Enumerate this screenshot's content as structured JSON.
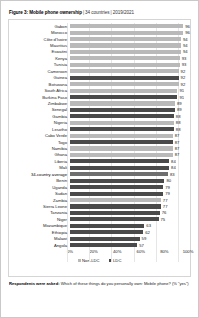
{
  "title": {
    "label": "Figure 3: Mobile phone ownership",
    "separator": "|",
    "countries": "34 countries",
    "period": "2019/2021"
  },
  "footnote": {
    "lead": "Respondents were asked:",
    "text": " Which of these things do you personally own: Mobile phone? (% \"yes\")"
  },
  "legend": {
    "position": "bottom-center",
    "items": [
      {
        "label": "Non-LDC",
        "color": "#b9b9b9",
        "key": "non_ldc"
      },
      {
        "label": "LDC",
        "color": "#4a4a4a",
        "key": "ldc"
      }
    ]
  },
  "axis": {
    "ticks": [
      "0%",
      "20%",
      "40%",
      "60%",
      "80%",
      "100%"
    ],
    "values": [
      0,
      20,
      40,
      60,
      80,
      100
    ]
  },
  "chart_data": {
    "type": "bar",
    "orientation": "horizontal",
    "xlabel": "",
    "ylabel": "",
    "xlim": [
      0,
      100
    ],
    "grid": true,
    "legend_position": "bottom-center",
    "categories": [
      "Gabon",
      "Morocco",
      "Côte d'Ivoire",
      "Mauritius",
      "Eswatini",
      "Kenya",
      "Tunisia",
      "Cameroon",
      "Guinea",
      "Botswana",
      "South Africa",
      "Burkina Faso",
      "Zimbabwe",
      "Senegal",
      "Gambia",
      "Nigeria",
      "Lesotho",
      "Cabo Verde",
      "Togo",
      "Namibia",
      "Ghana",
      "Liberia",
      "Mali",
      "34-country average",
      "Benin",
      "Uganda",
      "Sudan",
      "Zambia",
      "Sierra Leone",
      "Tanzania",
      "Niger",
      "Mozambique",
      "Ethiopia",
      "Malawi",
      "Angola"
    ],
    "values": [
      96,
      96,
      94,
      94,
      94,
      93,
      93,
      92,
      92,
      92,
      91,
      91,
      89,
      89,
      88,
      88,
      88,
      87,
      87,
      87,
      87,
      84,
      84,
      83,
      80,
      79,
      79,
      77,
      77,
      76,
      75,
      63,
      62,
      59,
      57
    ],
    "groups": [
      "non_ldc",
      "non_ldc",
      "non_ldc",
      "non_ldc",
      "non_ldc",
      "non_ldc",
      "non_ldc",
      "non_ldc",
      "ldc",
      "non_ldc",
      "non_ldc",
      "ldc",
      "non_ldc",
      "ldc",
      "ldc",
      "non_ldc",
      "ldc",
      "non_ldc",
      "ldc",
      "non_ldc",
      "non_ldc",
      "ldc",
      "ldc",
      "average",
      "ldc",
      "ldc",
      "ldc",
      "non_ldc",
      "ldc",
      "ldc",
      "ldc",
      "ldc",
      "ldc",
      "ldc",
      "ldc"
    ],
    "series": [
      {
        "name": "Non-LDC",
        "color": "#b9b9b9",
        "points": [
          {
            "category": "Gabon",
            "value": 96
          },
          {
            "category": "Morocco",
            "value": 96
          },
          {
            "category": "Côte d'Ivoire",
            "value": 94
          },
          {
            "category": "Mauritius",
            "value": 94
          },
          {
            "category": "Eswatini",
            "value": 94
          },
          {
            "category": "Kenya",
            "value": 93
          },
          {
            "category": "Tunisia",
            "value": 93
          },
          {
            "category": "Cameroon",
            "value": 92
          },
          {
            "category": "Botswana",
            "value": 92
          },
          {
            "category": "South Africa",
            "value": 91
          },
          {
            "category": "Zimbabwe",
            "value": 89
          },
          {
            "category": "Nigeria",
            "value": 88
          },
          {
            "category": "Cabo Verde",
            "value": 87
          },
          {
            "category": "Namibia",
            "value": 87
          },
          {
            "category": "Ghana",
            "value": 87
          },
          {
            "category": "Zambia",
            "value": 77
          }
        ]
      },
      {
        "name": "LDC",
        "color": "#4a4a4a",
        "points": [
          {
            "category": "Guinea",
            "value": 92
          },
          {
            "category": "Burkina Faso",
            "value": 91
          },
          {
            "category": "Senegal",
            "value": 89
          },
          {
            "category": "Gambia",
            "value": 88
          },
          {
            "category": "Lesotho",
            "value": 88
          },
          {
            "category": "Togo",
            "value": 87
          },
          {
            "category": "Liberia",
            "value": 84
          },
          {
            "category": "Mali",
            "value": 84
          },
          {
            "category": "Benin",
            "value": 80
          },
          {
            "category": "Uganda",
            "value": 79
          },
          {
            "category": "Sudan",
            "value": 79
          },
          {
            "category": "Sierra Leone",
            "value": 77
          },
          {
            "category": "Tanzania",
            "value": 76
          },
          {
            "category": "Niger",
            "value": 75
          },
          {
            "category": "Mozambique",
            "value": 63
          },
          {
            "category": "Ethiopia",
            "value": 62
          },
          {
            "category": "Malawi",
            "value": 59
          },
          {
            "category": "Angola",
            "value": 57
          }
        ]
      },
      {
        "name": "34-country average",
        "color": "#6f6f6f",
        "points": [
          {
            "category": "34-country average",
            "value": 83
          }
        ]
      }
    ],
    "rows": [
      {
        "label": "Gabon",
        "value": 96,
        "group": "non_ldc"
      },
      {
        "label": "Morocco",
        "value": 96,
        "group": "non_ldc"
      },
      {
        "label": "Côte d'Ivoire",
        "value": 94,
        "group": "non_ldc"
      },
      {
        "label": "Mauritius",
        "value": 94,
        "group": "non_ldc"
      },
      {
        "label": "Eswatini",
        "value": 94,
        "group": "non_ldc"
      },
      {
        "label": "Kenya",
        "value": 93,
        "group": "non_ldc"
      },
      {
        "label": "Tunisia",
        "value": 93,
        "group": "non_ldc"
      },
      {
        "label": "Cameroon",
        "value": 92,
        "group": "non_ldc"
      },
      {
        "label": "Guinea",
        "value": 92,
        "group": "ldc"
      },
      {
        "label": "Botswana",
        "value": 92,
        "group": "non_ldc"
      },
      {
        "label": "South Africa",
        "value": 91,
        "group": "non_ldc"
      },
      {
        "label": "Burkina Faso",
        "value": 91,
        "group": "ldc"
      },
      {
        "label": "Zimbabwe",
        "value": 89,
        "group": "non_ldc"
      },
      {
        "label": "Senegal",
        "value": 89,
        "group": "ldc"
      },
      {
        "label": "Gambia",
        "value": 88,
        "group": "ldc"
      },
      {
        "label": "Nigeria",
        "value": 88,
        "group": "non_ldc"
      },
      {
        "label": "Lesotho",
        "value": 88,
        "group": "ldc"
      },
      {
        "label": "Cabo Verde",
        "value": 87,
        "group": "non_ldc"
      },
      {
        "label": "Togo",
        "value": 87,
        "group": "ldc"
      },
      {
        "label": "Namibia",
        "value": 87,
        "group": "non_ldc"
      },
      {
        "label": "Ghana",
        "value": 87,
        "group": "non_ldc"
      },
      {
        "label": "Liberia",
        "value": 84,
        "group": "ldc"
      },
      {
        "label": "Mali",
        "value": 84,
        "group": "ldc"
      },
      {
        "label": "34-country average",
        "value": 83,
        "group": "average"
      },
      {
        "label": "Benin",
        "value": 80,
        "group": "ldc"
      },
      {
        "label": "Uganda",
        "value": 79,
        "group": "ldc"
      },
      {
        "label": "Sudan",
        "value": 79,
        "group": "ldc"
      },
      {
        "label": "Zambia",
        "value": 77,
        "group": "non_ldc"
      },
      {
        "label": "Sierra Leone",
        "value": 77,
        "group": "ldc"
      },
      {
        "label": "Tanzania",
        "value": 76,
        "group": "ldc"
      },
      {
        "label": "Niger",
        "value": 75,
        "group": "ldc"
      },
      {
        "label": "Mozambique",
        "value": 63,
        "group": "ldc"
      },
      {
        "label": "Ethiopia",
        "value": 62,
        "group": "ldc"
      },
      {
        "label": "Malawi",
        "value": 59,
        "group": "ldc"
      },
      {
        "label": "Angola",
        "value": 57,
        "group": "ldc"
      }
    ]
  }
}
